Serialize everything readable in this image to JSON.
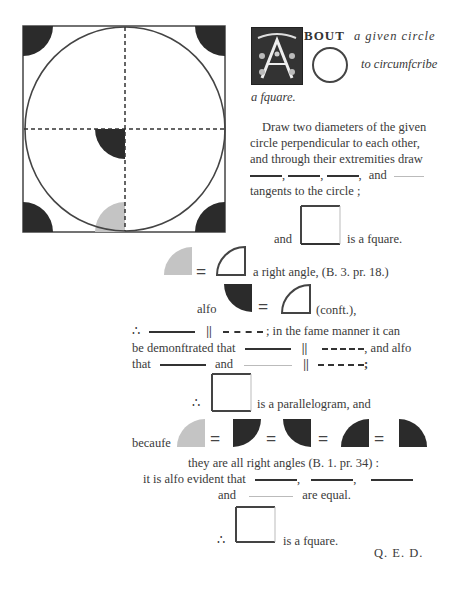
{
  "figure": {
    "colors": {
      "dark": "#2b2b2b",
      "light": "#c4c4c4",
      "line": "#333333"
    }
  },
  "heading": {
    "drop_cap": "A",
    "line1_caps": "BOUT",
    "line1_italic": "a given circle",
    "line2_italic": "to circumfcribe",
    "line3_italic": "a fquare."
  },
  "paragraph1": {
    "line1": "Draw two diameters of the given",
    "line2": "circle perpendicular to each other,",
    "line3": "and through their extremities draw",
    "comma": ",",
    "and": "and",
    "line5": "tangents to the circle ;"
  },
  "square_statement": {
    "and": "and",
    "rest": "is a fquare."
  },
  "right_angle_line": {
    "eq": "=",
    "text": "a right angle, (B. 3. pr. 18.)"
  },
  "also_line": {
    "also": "alfo",
    "eq": "=",
    "text": "(conft.),"
  },
  "therefore1": {
    "symbol": "∴",
    "parallel": "||",
    "rest": "; in the fame manner it can"
  },
  "demonstrated": {
    "lead": "be demonftrated that",
    "parallel": "||",
    "rest": ", and alfo"
  },
  "that_line": {
    "that": "that",
    "and": "and",
    "parallel": "||",
    "end": ";"
  },
  "parallelogram": {
    "symbol": "∴",
    "text": "is a parallelogram, and"
  },
  "because_line": {
    "because": "becaufe",
    "eq": "="
  },
  "right_angles": {
    "text": "they are all right angles (B. 1. pr. 34) :"
  },
  "evident": {
    "lead": "it is alfo evident that",
    "comma": ","
  },
  "equal": {
    "and": "and",
    "rest": "are equal."
  },
  "conclusion": {
    "symbol": "∴",
    "text": "is a fquare."
  },
  "qed": "Q. E. D."
}
